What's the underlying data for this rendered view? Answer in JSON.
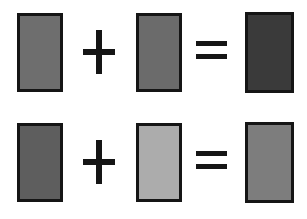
{
  "figure": {
    "type": "color-mixing-equations",
    "background_color": "#ffffff",
    "swatch_border_color": "#151515",
    "operator_color": "#151515",
    "rows": [
      {
        "label": "equation-row-1",
        "operand_a": {
          "name": "medium-gray",
          "color": "#6e6e6e",
          "label": ""
        },
        "operator_1": {
          "name": "plus-sign",
          "glyph": "+"
        },
        "operand_b": {
          "name": "medium-gray",
          "color": "#6b6b6b",
          "label": ""
        },
        "operator_2": {
          "name": "equals-sign",
          "glyph": "="
        },
        "result": {
          "name": "dark-gray",
          "color": "#3a3a3a",
          "label": ""
        }
      },
      {
        "label": "equation-row-2",
        "operand_a": {
          "name": "medium-dark-gray",
          "color": "#5e5e5e",
          "label": ""
        },
        "operator_1": {
          "name": "plus-sign",
          "glyph": "+"
        },
        "operand_b": {
          "name": "light-gray",
          "color": "#acacac",
          "label": ""
        },
        "operator_2": {
          "name": "equals-sign",
          "glyph": "="
        },
        "result": {
          "name": "medium-gray",
          "color": "#7d7d7d",
          "label": ""
        }
      }
    ]
  }
}
